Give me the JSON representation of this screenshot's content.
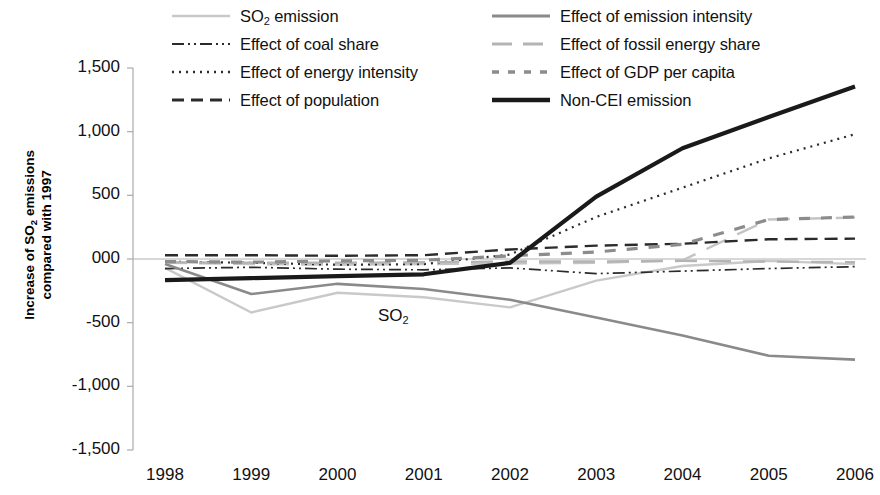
{
  "chart_data": {
    "type": "line",
    "title": "",
    "xlabel": "",
    "ylabel": "Increase of SO2 emissions compared with 1997",
    "ylabel_line1": "Increase of SO",
    "ylabel_line1_sub": "2",
    "ylabel_line1_rest": " emissions",
    "ylabel_line2": "compared with 1997",
    "categories": [
      "1998",
      "1999",
      "2000",
      "2001",
      "2002",
      "2003",
      "2004",
      "2005",
      "2006"
    ],
    "x": [
      1998,
      1999,
      2000,
      2001,
      2002,
      2003,
      2004,
      2005,
      2006
    ],
    "ylim": [
      -1500,
      1500
    ],
    "ytick_values": [
      1500,
      1000,
      500,
      0,
      -500,
      -1000,
      -1500
    ],
    "ytick_labels": [
      "1,500",
      "1,000",
      "500",
      "000",
      "-500",
      "-1,000",
      "-1,500"
    ],
    "grid": false,
    "legend_position": "top",
    "annotations": [
      {
        "text": "SO",
        "sub": "2",
        "x": 2000.6,
        "y": -460
      }
    ],
    "series": [
      {
        "name": "SO2 emission",
        "legend_text": "SO",
        "legend_sub": "2",
        "legend_rest": " emission",
        "style": "solid",
        "color": "#c9c9c9",
        "width": 2.4,
        "dash": "",
        "values": [
          -70,
          -420,
          -265,
          -300,
          -380,
          -170,
          -55,
          -15,
          -40
        ]
      },
      {
        "name": "Effect of coal share",
        "legend_text": "Effect of coal share",
        "style": "dash-dot-dot",
        "color": "#2b2b2b",
        "width": 1.7,
        "dash": "12,4,2,4,2,4",
        "values": [
          -75,
          -65,
          -80,
          -85,
          -70,
          -115,
          -95,
          -75,
          -60
        ]
      },
      {
        "name": "Effect of energy intensity",
        "legend_text": "Effect of energy intensity",
        "style": "dotted",
        "color": "#2b2b2b",
        "width": 2.2,
        "dash": "2,5",
        "values": [
          -20,
          -30,
          -45,
          -40,
          35,
          330,
          560,
          790,
          980
        ]
      },
      {
        "name": "Effect of population",
        "legend_text": "Effect of population",
        "style": "dashed",
        "color": "#2b2b2b",
        "width": 2.4,
        "dash": "13,7",
        "values": [
          30,
          30,
          25,
          30,
          75,
          105,
          120,
          155,
          160
        ]
      },
      {
        "name": "Effect of emission intensity",
        "legend_text": "Effect of emission intensity",
        "style": "solid",
        "color": "#8a8a8a",
        "width": 2.6,
        "dash": "",
        "values": [
          -40,
          -275,
          -195,
          -235,
          -320,
          -460,
          -600,
          -760,
          -790
        ]
      },
      {
        "name": "Effect of fossil energy share",
        "legend_text": "Effect of fossil energy share",
        "style": "long-dash",
        "color": "#b4b4b4",
        "width": 2.4,
        "dash": "22,12",
        "values": [
          -25,
          -30,
          -30,
          -25,
          -20,
          -20,
          -15,
          -20,
          -25
        ]
      },
      {
        "name": "Effect of GDP per capita",
        "legend_text": "Effect of GDP per capita",
        "style": "medium-dash",
        "color": "#8c8c8c",
        "width": 3.2,
        "dash": "11,11",
        "values": [
          -20,
          -25,
          -15,
          -10,
          25,
          55,
          115,
          310,
          330
        ]
      },
      {
        "name": "Non-CEI emission",
        "legend_text": "Non-CEI emission",
        "style": "thick-solid",
        "color": "#1a1a1a",
        "width": 4.2,
        "dash": "",
        "values": [
          -166,
          -150,
          -135,
          -120,
          -30,
          490,
          870,
          1115,
          1355
        ]
      }
    ],
    "secondary_lines": [
      {
        "name": "fossil energy share lower",
        "color": "#c4c4c4",
        "width": 2.4,
        "dash": "22,12",
        "values": [
          -30,
          -40,
          -45,
          -40,
          -35,
          -30,
          -10,
          310,
          325
        ]
      }
    ]
  }
}
